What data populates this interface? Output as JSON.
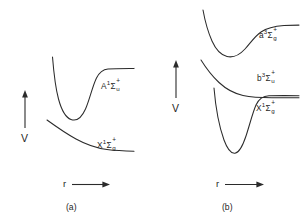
{
  "figure": {
    "background_color": "#ffffff",
    "stroke_color": "#2b2b2b",
    "text_color": "#1f1f1f",
    "width": 304,
    "height": 218
  },
  "panels": [
    {
      "id": "a",
      "caption": "(a)",
      "y_axis": {
        "label": "V",
        "direction": "up",
        "arrow_icon": "arrow-up-icon"
      },
      "x_axis": {
        "label": "r",
        "direction": "right",
        "arrow_icon": "arrow-right-icon"
      },
      "curves": [
        {
          "id": "A1Sigma_u_plus",
          "state_letter": "A",
          "multiplicity": "1",
          "term_symbol": "Σ",
          "parity_charge": "+",
          "symmetry_sub": "u",
          "label_plain": "A¹Σ⁺ᵤ",
          "shape": "bound-well-with-high-asymptote"
        },
        {
          "id": "X1Sigma_g_plus",
          "state_letter": "X",
          "multiplicity": "1",
          "term_symbol": "Σ",
          "parity_charge": "+",
          "symmetry_sub": "g",
          "label_plain": "X¹Σ⁺_g",
          "shape": "shallow-monotonic-descending"
        }
      ]
    },
    {
      "id": "b",
      "caption": "(b)",
      "y_axis": {
        "label": "V",
        "direction": "up",
        "arrow_icon": "arrow-up-icon"
      },
      "x_axis": {
        "label": "r",
        "direction": "right",
        "arrow_icon": "arrow-right-icon"
      },
      "curves": [
        {
          "id": "a3Sigma_g_plus",
          "state_letter": "a",
          "multiplicity": "3",
          "term_symbol": "Σ",
          "parity_charge": "+",
          "symmetry_sub": "g",
          "label_plain": "a³Σ⁺_g",
          "shape": "shallow-well-rising-asymptote"
        },
        {
          "id": "b3Sigma_u_plus",
          "state_letter": "b",
          "multiplicity": "3",
          "term_symbol": "Σ",
          "parity_charge": "+",
          "symmetry_sub": "u",
          "label_plain": "b³Σ⁺ᵤ",
          "shape": "repulsive-descending-to-asymptote"
        },
        {
          "id": "X1Sigma_g_plus_b",
          "state_letter": "X",
          "multiplicity": "1",
          "term_symbol": "Σ",
          "parity_charge": "+",
          "symmetry_sub": "g",
          "label_plain": "X¹Σ⁺_g",
          "shape": "deep-narrow-well"
        }
      ]
    }
  ]
}
